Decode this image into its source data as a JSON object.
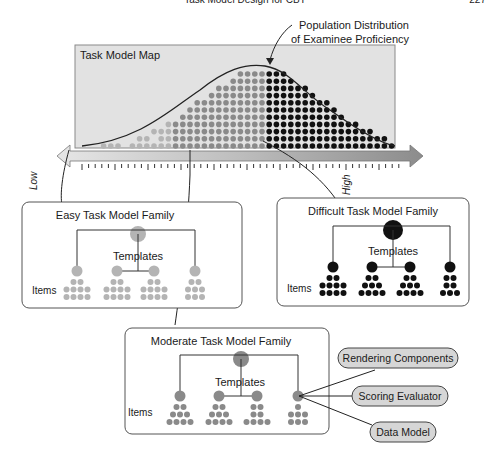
{
  "header": {
    "running_title": "Task Model Design for CBT",
    "page_number": "227"
  },
  "map": {
    "title": "Task Model Map",
    "curve_label_line1": "Population Distribution",
    "curve_label_line2": "of Examinee Proficiency",
    "axis_low": "Low",
    "axis_high": "High"
  },
  "families": {
    "easy": {
      "title": "Easy Task Model Family",
      "templates_label": "Templates",
      "items_label": "Items",
      "color": "#b4b4b4"
    },
    "difficult": {
      "title": "Difficult Task Model Family",
      "templates_label": "Templates",
      "items_label": "Items",
      "color": "#111111"
    },
    "moderate": {
      "title": "Moderate Task Model Family",
      "templates_label": "Templates",
      "items_label": "Items",
      "color": "#8a8a8a"
    }
  },
  "components": [
    {
      "label": "Rendering Components"
    },
    {
      "label": "Scoring Evaluator"
    },
    {
      "label": "Data Model"
    }
  ],
  "colors": {
    "map_bg": "#e2e2e2",
    "easy": "#b4b4b4",
    "moderate": "#8a8a8a",
    "difficult": "#111111",
    "pill_bg": "#d6d6d6"
  }
}
